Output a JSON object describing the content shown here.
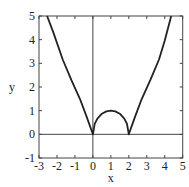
{
  "chart_data": {
    "type": "line",
    "title": "",
    "xlabel": "x",
    "ylabel": "y",
    "xlim": [
      -3,
      5
    ],
    "ylim": [
      -1,
      5
    ],
    "xticks": [
      "-3",
      "-2",
      "-1",
      "0",
      "1",
      "2",
      "3",
      "4",
      "5"
    ],
    "yticks": [
      "-1",
      "0",
      "1",
      "2",
      "3",
      "4",
      "5"
    ],
    "grid": false,
    "series": [
      {
        "name": "curve",
        "x": [
          -2.55,
          -2.2,
          -1.68,
          -1.2,
          -0.71,
          -0.35,
          0,
          0.1,
          0.25,
          0.5,
          0.75,
          1,
          1.25,
          1.5,
          1.75,
          1.9,
          2,
          2.35,
          2.71,
          3.2,
          3.68,
          4.0,
          4.36
        ],
        "y": [
          5,
          4.3,
          3.16,
          2.3,
          1.48,
          0.75,
          0,
          0.44,
          0.66,
          0.87,
          0.97,
          1,
          0.97,
          0.87,
          0.66,
          0.44,
          0,
          0.75,
          1.48,
          2.3,
          3.16,
          3.95,
          5
        ]
      }
    ]
  }
}
